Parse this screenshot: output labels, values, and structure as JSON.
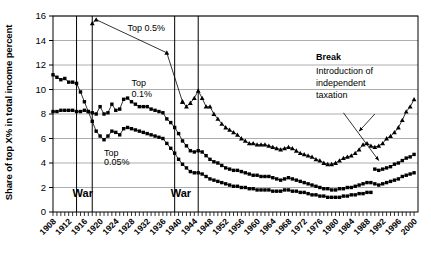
{
  "chart_data": {
    "type": "line",
    "title": "",
    "xlabel": "",
    "ylabel": "Share of top X% in total income percent",
    "ylim": [
      0,
      16
    ],
    "xlim": [
      1908,
      2001
    ],
    "yticks": [
      0,
      2,
      4,
      6,
      8,
      10,
      12,
      14,
      16
    ],
    "xticks": [
      1908,
      1912,
      1916,
      1920,
      1924,
      1928,
      1932,
      1936,
      1940,
      1944,
      1948,
      1952,
      1956,
      1960,
      1964,
      1968,
      1972,
      1976,
      1980,
      1984,
      1988,
      1992,
      1996,
      2000
    ],
    "grid": true,
    "legend_position": "inline-annotations",
    "series": [
      {
        "name": "Top 0.5%",
        "label": "Top 0.5%",
        "marker": "triangle",
        "x": [
          1918,
          1919,
          1937,
          1941
        ],
        "values": [
          15.4,
          15.7,
          13.0,
          9.0
        ]
      },
      {
        "name": "Top 1%",
        "label": "",
        "marker": "triangle",
        "x": [
          1941,
          1942,
          1943,
          1944,
          1945,
          1946,
          1947,
          1948,
          1949,
          1950,
          1951,
          1952,
          1953,
          1954,
          1955,
          1956,
          1957,
          1958,
          1959,
          1960,
          1961,
          1962,
          1963,
          1964,
          1965,
          1966,
          1967,
          1968,
          1969,
          1970,
          1971,
          1972,
          1973,
          1974,
          1975,
          1976,
          1977,
          1978,
          1979,
          1980,
          1981,
          1982,
          1983,
          1984,
          1985,
          1986,
          1987,
          1988,
          1989,
          1990,
          1991,
          1992,
          1993,
          1994,
          1995,
          1996,
          1997,
          1998,
          1999,
          2000
        ],
        "values": [
          9.0,
          8.6,
          8.9,
          9.3,
          9.9,
          9.3,
          8.6,
          8.6,
          8.0,
          7.6,
          7.2,
          6.9,
          6.7,
          6.5,
          6.3,
          6.0,
          5.8,
          5.6,
          5.6,
          5.5,
          5.5,
          5.5,
          5.4,
          5.3,
          5.2,
          5.1,
          5.2,
          5.3,
          5.2,
          5.0,
          4.8,
          4.7,
          4.6,
          4.5,
          4.3,
          4.2,
          4.0,
          3.9,
          3.9,
          4.0,
          4.2,
          4.4,
          4.5,
          4.6,
          4.8,
          5.1,
          5.5,
          5.6,
          5.4,
          5.3,
          5.4,
          5.6,
          6.0,
          6.2,
          6.5,
          6.9,
          7.5,
          8.2,
          8.6,
          9.2
        ]
      },
      {
        "name": "Top 0.1%",
        "label": "Top 0.1%",
        "marker": "square",
        "x": [
          1908,
          1909,
          1910,
          1911,
          1912,
          1913,
          1914,
          1915,
          1916,
          1917,
          1918,
          1919,
          1920,
          1921,
          1922,
          1923,
          1924,
          1925,
          1926,
          1927,
          1928,
          1929,
          1930,
          1931,
          1932,
          1933,
          1934,
          1935,
          1936,
          1937,
          1938,
          1939,
          1940,
          1941,
          1942,
          1943,
          1944,
          1945,
          1946,
          1947,
          1948,
          1949,
          1950,
          1951,
          1952,
          1953,
          1954,
          1955,
          1956,
          1957,
          1958,
          1959,
          1960,
          1961,
          1962,
          1963,
          1964,
          1965,
          1966,
          1967,
          1968,
          1969,
          1970,
          1971,
          1972,
          1973,
          1974,
          1975,
          1976,
          1977,
          1978,
          1979,
          1980,
          1981,
          1982,
          1983,
          1984,
          1985,
          1986,
          1987,
          1988,
          1989,
          1990,
          1991,
          1992,
          1993,
          1994,
          1995,
          1996,
          1997,
          1998,
          1999,
          2000
        ],
        "values": [
          8.2,
          8.2,
          8.3,
          8.3,
          8.3,
          8.3,
          8.2,
          8.2,
          8.3,
          8.2,
          8.1,
          8.0,
          8.6,
          8.0,
          8.1,
          8.8,
          8.3,
          8.4,
          9.2,
          9.3,
          9.0,
          8.8,
          8.6,
          8.6,
          8.6,
          8.4,
          8.3,
          8.2,
          8.1,
          7.6,
          7.3,
          6.9,
          6.4,
          5.8,
          5.4,
          5.0,
          4.9,
          5.0,
          4.9,
          4.6,
          4.3,
          4.1,
          4.0,
          3.8,
          3.6,
          3.5,
          3.4,
          3.4,
          3.3,
          3.2,
          3.1,
          3.0,
          3.0,
          2.9,
          2.9,
          2.9,
          2.8,
          2.7,
          2.6,
          2.7,
          2.8,
          2.7,
          2.6,
          2.5,
          2.4,
          2.3,
          2.2,
          2.1,
          2.0,
          1.9,
          1.9,
          1.8,
          1.8,
          1.9,
          1.9,
          2.0,
          2.0,
          2.1,
          2.2,
          2.3,
          2.4,
          2.4,
          3.5,
          3.4,
          3.5,
          3.6,
          3.7,
          3.9,
          4.0,
          4.2,
          4.4,
          4.5,
          4.7
        ]
      },
      {
        "name": "Top 0.05%",
        "label": "Top 0.05%",
        "marker": "square",
        "x": [
          1908,
          1909,
          1910,
          1911,
          1912,
          1913,
          1914,
          1915,
          1916,
          1917,
          1918,
          1919,
          1920,
          1921,
          1922,
          1923,
          1924,
          1925,
          1926,
          1927,
          1928,
          1929,
          1930,
          1931,
          1932,
          1933,
          1934,
          1935,
          1936,
          1937,
          1938,
          1939,
          1940,
          1941,
          1942,
          1943,
          1944,
          1945,
          1946,
          1947,
          1948,
          1949,
          1950,
          1951,
          1952,
          1953,
          1954,
          1955,
          1956,
          1957,
          1958,
          1959,
          1960,
          1961,
          1962,
          1963,
          1964,
          1965,
          1966,
          1967,
          1968,
          1969,
          1970,
          1971,
          1972,
          1973,
          1974,
          1975,
          1976,
          1977,
          1978,
          1979,
          1980,
          1981,
          1982,
          1983,
          1984,
          1985,
          1986,
          1987,
          1988,
          1989,
          1990,
          1991,
          1992,
          1993,
          1994,
          1995,
          1996,
          1997,
          1998,
          1999,
          2000
        ],
        "values": [
          11.2,
          11.0,
          10.8,
          10.9,
          10.6,
          10.6,
          10.5,
          9.8,
          9.0,
          8.2,
          7.4,
          6.6,
          6.2,
          5.9,
          6.2,
          6.6,
          6.5,
          6.3,
          6.8,
          6.9,
          6.8,
          6.7,
          6.6,
          6.5,
          6.4,
          6.3,
          6.2,
          6.1,
          6.0,
          5.6,
          5.2,
          4.8,
          4.3,
          3.9,
          3.6,
          3.3,
          3.2,
          3.2,
          3.1,
          2.9,
          2.7,
          2.6,
          2.5,
          2.4,
          2.3,
          2.2,
          2.1,
          2.1,
          2.0,
          2.0,
          1.9,
          1.9,
          1.8,
          1.8,
          1.8,
          1.8,
          1.7,
          1.7,
          1.7,
          1.8,
          1.8,
          1.7,
          1.7,
          1.6,
          1.6,
          1.5,
          1.4,
          1.4,
          1.3,
          1.3,
          1.2,
          1.2,
          1.2,
          1.2,
          1.3,
          1.3,
          1.4,
          1.4,
          1.5,
          1.5,
          1.6,
          1.6,
          2.3,
          2.2,
          2.3,
          2.4,
          2.5,
          2.6,
          2.7,
          2.9,
          3.0,
          3.1,
          3.2
        ]
      }
    ],
    "annotations": [
      {
        "id": "top05",
        "text": "Top 0.5%",
        "x": 1927,
        "y": 14.8
      },
      {
        "id": "top01",
        "text": "Top",
        "x": 1928,
        "y": 10.3
      },
      {
        "id": "top01b",
        "text": "0.1%",
        "x": 1928,
        "y": 9.4
      },
      {
        "id": "top005",
        "text": "Top",
        "x": 1921,
        "y": 4.6
      },
      {
        "id": "top005b",
        "text": "0.05%",
        "x": 1921,
        "y": 3.8
      },
      {
        "id": "war1",
        "text": "War",
        "x": 1913,
        "y": 1.2
      },
      {
        "id": "war2",
        "text": "War",
        "x": 1938,
        "y": 1.2
      },
      {
        "id": "break",
        "text": "Break",
        "x": 1975,
        "y": 12.4
      },
      {
        "id": "break-line1",
        "text": "Introduction of",
        "x": 1975,
        "y": 11.3
      },
      {
        "id": "break-line2",
        "text": "independent",
        "x": 1975,
        "y": 10.3
      },
      {
        "id": "break-line3",
        "text": "taxation",
        "x": 1975,
        "y": 9.3
      }
    ],
    "vertical_lines": [
      {
        "label": "war1-start",
        "x": 1914
      },
      {
        "label": "war1-end",
        "x": 1918
      },
      {
        "label": "war2-start",
        "x": 1939
      },
      {
        "label": "war2-end",
        "x": 1945
      }
    ],
    "arrows": [
      {
        "id": "break-arrow-upper",
        "x1": 1990,
        "y1": 8.0,
        "x2": 1986,
        "y2": 6.6
      },
      {
        "id": "break-arrow-lower",
        "x1": 1982,
        "y1": 8.1,
        "x2": 1991,
        "y2": 4.2
      }
    ]
  }
}
